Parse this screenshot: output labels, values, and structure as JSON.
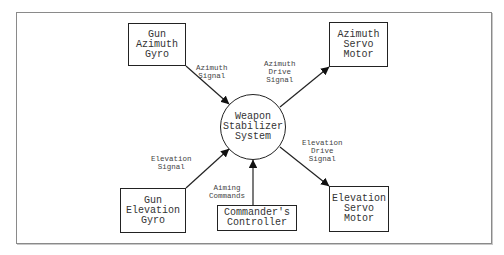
{
  "diagram": {
    "type": "block-diagram",
    "frame": {
      "x": 16,
      "y": 12,
      "w": 474,
      "h": 230
    },
    "center": {
      "id": "weapon-stabilizer-system",
      "lines": [
        "Weapon",
        "Stabilizer",
        "System"
      ],
      "cx": 253,
      "cy": 127,
      "r": 33
    },
    "nodes": [
      {
        "id": "gun-azimuth-gyro",
        "lines": [
          "Gun",
          "Azimuth",
          "Gyro"
        ],
        "x": 128,
        "y": 23,
        "w": 58,
        "h": 43
      },
      {
        "id": "azimuth-servo-motor",
        "lines": [
          "Azimuth",
          "Servo",
          "Motor"
        ],
        "x": 329,
        "y": 22,
        "w": 59,
        "h": 45
      },
      {
        "id": "gun-elevation-gyro",
        "lines": [
          "Gun",
          "Elevation",
          "Gyro"
        ],
        "x": 120,
        "y": 188,
        "w": 66,
        "h": 45
      },
      {
        "id": "commanders-controller",
        "lines": [
          "Commander's",
          "Controller"
        ],
        "x": 217,
        "y": 205,
        "w": 80,
        "h": 26
      },
      {
        "id": "elevation-servo-motor",
        "lines": [
          "Elevation",
          "Servo",
          "Motor"
        ],
        "x": 329,
        "y": 186,
        "w": 60,
        "h": 46
      }
    ],
    "edges": [
      {
        "id": "azimuth-signal",
        "from": "gun-azimuth-gyro",
        "to": "weapon-stabilizer-system",
        "label": [
          "Azimuth",
          "Signal"
        ],
        "x1": 186,
        "y1": 66,
        "x2": 229,
        "y2": 104,
        "lx": 196,
        "ly": 64
      },
      {
        "id": "azimuth-drive-signal",
        "from": "weapon-stabilizer-system",
        "to": "azimuth-servo-motor",
        "label": [
          "Azimuth",
          "Drive",
          "Signal"
        ],
        "x1": 280,
        "y1": 107,
        "x2": 329,
        "y2": 67,
        "lx": 264,
        "ly": 60
      },
      {
        "id": "elevation-signal",
        "from": "gun-elevation-gyro",
        "to": "weapon-stabilizer-system",
        "label": [
          "Elevation",
          "Signal"
        ],
        "x1": 186,
        "y1": 188,
        "x2": 229,
        "y2": 149,
        "lx": 151,
        "ly": 155
      },
      {
        "id": "aiming-commands",
        "from": "commanders-controller",
        "to": "weapon-stabilizer-system",
        "label": [
          "Aiming",
          "Commands"
        ],
        "x1": 253,
        "y1": 205,
        "x2": 253,
        "y2": 160,
        "lx": 209,
        "ly": 184
      },
      {
        "id": "elevation-drive-signal",
        "from": "weapon-stabilizer-system",
        "to": "elevation-servo-motor",
        "label": [
          "Elevation",
          "Drive",
          "Signal"
        ],
        "x1": 280,
        "y1": 147,
        "x2": 329,
        "y2": 186,
        "lx": 302,
        "ly": 139
      }
    ],
    "colors": {
      "stroke": "#222222",
      "text": "#333333",
      "label": "#444444",
      "frame": "#8a8a8a"
    }
  }
}
